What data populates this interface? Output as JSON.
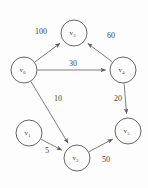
{
  "figure": {
    "background_color": "#fdfdfd",
    "node_stroke_color": "#555555",
    "edge_stroke_color": "#666666",
    "text_color": "#3a3a3a"
  },
  "chart_data": {
    "type": "diagram",
    "diagram_kind": "directed-weighted-graph",
    "title": "",
    "nodes": [
      {
        "id": "v0",
        "label": "v",
        "subscript": "0",
        "x": 24,
        "y": 70,
        "r": 13
      },
      {
        "id": "v1",
        "label": "v",
        "subscript": "1",
        "x": 29,
        "y": 133,
        "r": 13
      },
      {
        "id": "v2",
        "label": "v",
        "subscript": "2",
        "x": 77,
        "y": 158,
        "r": 13
      },
      {
        "id": "v3",
        "label": "v",
        "subscript": "3",
        "x": 74,
        "y": 33,
        "r": 13
      },
      {
        "id": "v4",
        "label": "v",
        "subscript": "4",
        "x": 123,
        "y": 70,
        "r": 13
      },
      {
        "id": "v5",
        "label": "v",
        "subscript": "5",
        "x": 128,
        "y": 131,
        "r": 13
      }
    ],
    "edges": [
      {
        "from": "v0",
        "to": "v3",
        "weight": "100",
        "label_x": 41,
        "label_y": 31
      },
      {
        "from": "v4",
        "to": "v3",
        "weight": "60",
        "label_x": 111,
        "label_y": 35
      },
      {
        "from": "v0",
        "to": "v4",
        "weight": "30",
        "label_x": 73,
        "label_y": 63
      },
      {
        "from": "v0",
        "to": "v2",
        "weight": "10",
        "label_x": 58,
        "label_y": 98
      },
      {
        "from": "v4",
        "to": "v5",
        "weight": "20",
        "label_x": 118,
        "label_y": 98
      },
      {
        "from": "v1",
        "to": "v2",
        "weight": "5",
        "label_x": 47,
        "label_y": 150
      },
      {
        "from": "v2",
        "to": "v5",
        "weight": "50",
        "label_x": 106,
        "label_y": 159
      }
    ]
  }
}
